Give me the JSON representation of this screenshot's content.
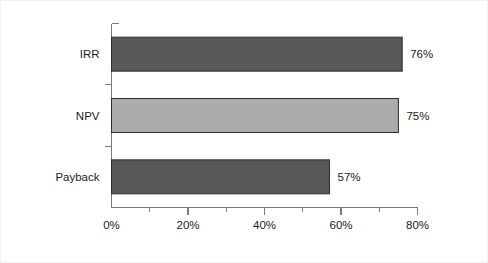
{
  "chart_data": {
    "type": "bar",
    "orientation": "horizontal",
    "title": "",
    "subtitle": "",
    "xlabel": "",
    "ylabel": "",
    "categories": [
      "IRR",
      "NPV",
      "Payback"
    ],
    "values": [
      76,
      75,
      57
    ],
    "value_labels": [
      "76%",
      "75%",
      "57%"
    ],
    "bar_colors": [
      "#585858",
      "#ababab",
      "#585858"
    ],
    "bar_outline_color": "#2e2e2e",
    "xlim": [
      0,
      80
    ],
    "x_major_ticks": [
      0,
      20,
      40,
      60,
      80
    ],
    "x_tick_labels": [
      "0%",
      "20%",
      "40%",
      "60%",
      "80%"
    ],
    "x_minor_ticks": [
      10,
      30,
      50,
      70
    ],
    "grid": false,
    "legend": false,
    "legend_position": "none",
    "axis_color": "#7a7a7a",
    "background_color": "#ffffff",
    "frame_color": "#f2f2f2",
    "text_color": "#1a1a1a"
  }
}
